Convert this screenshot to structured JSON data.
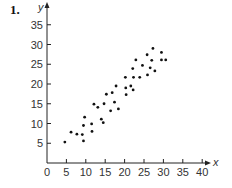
{
  "exercise_number": "1.",
  "chart_data": {
    "type": "scatter",
    "title": "",
    "xlabel": "x",
    "ylabel": "y",
    "xlim": [
      0,
      40
    ],
    "ylim": [
      0,
      35
    ],
    "x_ticks": [
      0,
      5,
      10,
      15,
      20,
      25,
      30,
      35,
      40
    ],
    "y_ticks": [
      5,
      10,
      15,
      20,
      25,
      30,
      35
    ],
    "grid": false,
    "legend": null,
    "points": [
      [
        4.6,
        5.3
      ],
      [
        6.2,
        7.8
      ],
      [
        7.7,
        7.3
      ],
      [
        9.1,
        7.2
      ],
      [
        9.4,
        5.6
      ],
      [
        9.4,
        9.5
      ],
      [
        9.7,
        11.6
      ],
      [
        11.5,
        9.9
      ],
      [
        11.6,
        8.0
      ],
      [
        12.1,
        14.9
      ],
      [
        13.1,
        14.1
      ],
      [
        14.0,
        11.1
      ],
      [
        14.5,
        10.2
      ],
      [
        14.7,
        15.0
      ],
      [
        15.3,
        17.4
      ],
      [
        16.4,
        13.2
      ],
      [
        16.8,
        17.8
      ],
      [
        17.4,
        15.4
      ],
      [
        17.8,
        19.5
      ],
      [
        18.4,
        13.7
      ],
      [
        20.2,
        21.7
      ],
      [
        20.3,
        19.0
      ],
      [
        20.4,
        17.3
      ],
      [
        21.6,
        19.5
      ],
      [
        22.2,
        18.5
      ],
      [
        22.3,
        21.7
      ],
      [
        22.1,
        23.9
      ],
      [
        22.9,
        26.1
      ],
      [
        23.9,
        21.7
      ],
      [
        24.6,
        24.7
      ],
      [
        25.8,
        27.4
      ],
      [
        25.9,
        22.3
      ],
      [
        26.6,
        24.1
      ],
      [
        27.0,
        26.0
      ],
      [
        27.3,
        29.0
      ],
      [
        27.8,
        23.3
      ],
      [
        29.5,
        28.0
      ],
      [
        29.5,
        26.1
      ],
      [
        30.6,
        26.1
      ]
    ],
    "point_color": "#111111",
    "axis_color": "#222222"
  }
}
